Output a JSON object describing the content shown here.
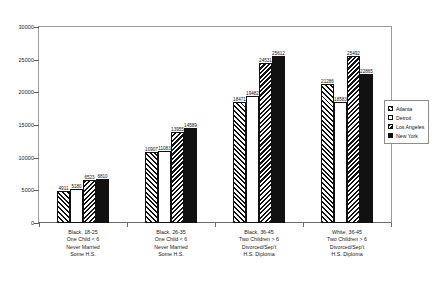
{
  "chart_data": {
    "type": "bar",
    "title": "",
    "subtitle": "",
    "xlabel": "",
    "ylabel": "",
    "ylim": [
      0,
      30000
    ],
    "ytick_step": 5000,
    "yticks": [
      "30000",
      "25000",
      "20000",
      "15000",
      "10000",
      "5000",
      "0"
    ],
    "grid": false,
    "legend_position": "right",
    "categories": [
      [
        "Black, 18-25",
        "One Child < 6",
        "Never Married",
        "Some H.S."
      ],
      [
        "Black, 26-35",
        "One Child < 6",
        "Never Married",
        "Some H.S."
      ],
      [
        "Black, 36-45",
        "Two Children > 6",
        "Divorced/Sep't",
        "H.S. Diploma"
      ],
      [
        "White, 36-45",
        "Two Children > 6",
        "Divorced/Sep't",
        "H.S. Diploma"
      ]
    ],
    "series": [
      {
        "name": "Atlanta",
        "fill": "hatch-a",
        "values": [
          4911,
          10907,
          18471,
          21286
        ]
      },
      {
        "name": "Detroit",
        "fill": "white",
        "values": [
          5180,
          11083,
          19482,
          18583
        ]
      },
      {
        "name": "Los Angeles",
        "fill": "hatch-b",
        "values": [
          6523,
          13955,
          24531,
          25492
        ]
      },
      {
        "name": "New York",
        "fill": "black",
        "values": [
          6810,
          14589,
          25612,
          22865
        ]
      }
    ]
  },
  "legend": {
    "items": [
      {
        "label": "Atlanta",
        "fill": "hatch-a"
      },
      {
        "label": "Detroit",
        "fill": "white"
      },
      {
        "label": "Los Angeles",
        "fill": "hatch-b"
      },
      {
        "label": "New York",
        "fill": "black"
      }
    ]
  },
  "colors": {
    "ink": "#111111",
    "axis": "#6a6a6a",
    "frame": "#9a9a9a",
    "background": "#ffffff"
  }
}
